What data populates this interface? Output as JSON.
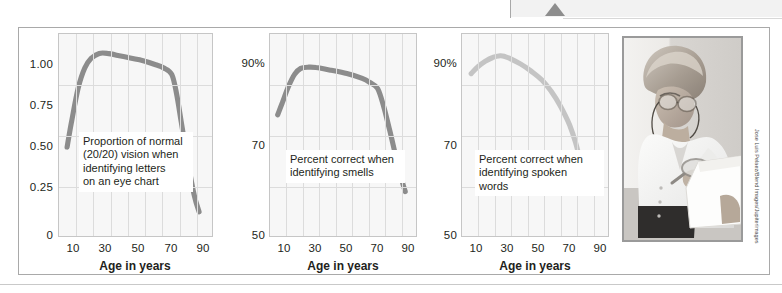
{
  "figure": {
    "caption_credit": "Jose Luis Pelaez/Blend Images/Jupiterimages",
    "marker_icon": "triangle-up-icon",
    "photo_alt": "older-woman-reading-with-magnifier-photo"
  },
  "colors": {
    "curve_dark": "#8c8c8c",
    "curve_light": "#c4c4c4",
    "plot_background": "#f7f7f7",
    "grid": "#dcdcdc",
    "frame": "#a9a9a9",
    "text": "#231f20"
  },
  "chart_data": [
    {
      "type": "line",
      "title": "",
      "annotation": "Proportion of normal\n(20/20) vision when\nidentifying letters\non an eye chart",
      "annotation_lines": [
        "Proportion of normal",
        "(20/20) vision when",
        "identifying letters",
        "on an eye chart"
      ],
      "xlabel": "Age in years",
      "ylabel": "",
      "xticks": [
        10,
        30,
        50,
        70,
        90
      ],
      "xtick_labels": [
        "10",
        "30",
        "50",
        "70",
        "90"
      ],
      "yticks": [
        0,
        0.25,
        0.5,
        0.75,
        1.0
      ],
      "ytick_labels": [
        "0",
        "0.25",
        "0.50",
        "0.75",
        "1.00"
      ],
      "xlim": [
        0,
        95
      ],
      "ylim": [
        0,
        1.25
      ],
      "grid": true,
      "series": [
        {
          "name": "visual acuity",
          "color": "#8c8c8c",
          "x": [
            5,
            8,
            12,
            16,
            20,
            25,
            30,
            40,
            50,
            60,
            65,
            70,
            73,
            76,
            80,
            84,
            87
          ],
          "y": [
            0.55,
            0.72,
            0.92,
            1.04,
            1.1,
            1.13,
            1.13,
            1.11,
            1.09,
            1.06,
            1.04,
            1.0,
            0.88,
            0.7,
            0.46,
            0.25,
            0.15
          ]
        }
      ]
    },
    {
      "type": "line",
      "title": "",
      "annotation": "Percent correct when\nidentifying smells",
      "annotation_lines": [
        "Percent correct when",
        "identifying smells"
      ],
      "xlabel": "Age in years",
      "ylabel": "",
      "xticks": [
        10,
        30,
        50,
        70,
        90
      ],
      "xtick_labels": [
        "10",
        "30",
        "50",
        "70",
        "90"
      ],
      "yticks": [
        50,
        70,
        90
      ],
      "ytick_labels": [
        "50",
        "70",
        "90%"
      ],
      "xlim": [
        0,
        95
      ],
      "ylim": [
        50,
        100
      ],
      "grid": true,
      "series": [
        {
          "name": "smell identification",
          "color": "#8c8c8c",
          "x": [
            5,
            8,
            12,
            16,
            20,
            25,
            30,
            40,
            50,
            60,
            65,
            70,
            74,
            78,
            82,
            86,
            88
          ],
          "y": [
            80,
            83,
            87,
            90,
            91.5,
            91.8,
            91.7,
            91.0,
            90.2,
            89.0,
            88.0,
            86.5,
            82.0,
            76.0,
            69.5,
            63.5,
            61.0
          ]
        }
      ]
    },
    {
      "type": "line",
      "title": "",
      "annotation": "Percent correct when\nidentifying spoken words",
      "annotation_lines": [
        "Percent correct when",
        "identifying spoken words"
      ],
      "xlabel": "Age in years",
      "ylabel": "",
      "xticks": [
        10,
        30,
        50,
        70,
        90
      ],
      "xtick_labels": [
        "10",
        "30",
        "50",
        "70",
        "90"
      ],
      "yticks": [
        50,
        70,
        90
      ],
      "ytick_labels": [
        "50",
        "70",
        "90%"
      ],
      "xlim": [
        0,
        95
      ],
      "ylim": [
        50,
        100
      ],
      "grid": true,
      "series": [
        {
          "name": "spoken word recognition",
          "color": "#c4c4c4",
          "x": [
            6,
            10,
            15,
            20,
            25,
            28,
            32,
            38,
            45,
            52,
            58,
            64,
            70,
            74,
            78,
            82
          ],
          "y": [
            90.2,
            91.8,
            93.2,
            94.2,
            94.6,
            94.4,
            93.8,
            92.6,
            90.8,
            88.6,
            85.8,
            82.2,
            77.5,
            73.0,
            67.0,
            61.5
          ]
        }
      ]
    }
  ]
}
